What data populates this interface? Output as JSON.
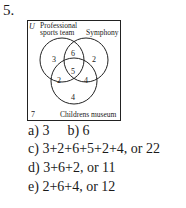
{
  "problem_number": "5.",
  "diagram": {
    "universe_label": "U",
    "sets": [
      {
        "name": "Professional sports team",
        "label_line1": "Professional",
        "label_line2": "sports team"
      },
      {
        "name": "Symphony",
        "label": "Symphony"
      },
      {
        "name": "Childrens museum",
        "label": "Childrens museum"
      }
    ],
    "regions": {
      "sports_only": "3",
      "sports_symphony_only": "6",
      "symphony_only": "2",
      "all_three": "5",
      "sports_museum_only": "2",
      "symphony_museum_only": "4",
      "museum_only": "4",
      "outside": "7"
    }
  },
  "answers": {
    "a": "a) 3",
    "b": "b) 6",
    "c": "c) 3+2+6+5+2+4, or 22",
    "d": "d) 3+6+2, or 11",
    "e": "e) 2+6+4, or 12"
  }
}
